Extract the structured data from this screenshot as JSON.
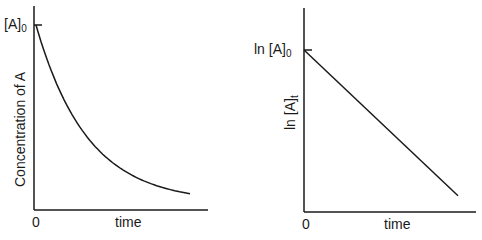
{
  "chart_data": [
    {
      "type": "line",
      "title": "",
      "xlabel": "time",
      "ylabel": "Concentration of A",
      "x_tick_labels": [
        "0"
      ],
      "y_tick_labels": [
        "[A]0"
      ],
      "y_tick_main": "[A]",
      "y_tick_sub": "0",
      "curve": "exponential decay",
      "x": [
        0,
        0.1,
        0.2,
        0.3,
        0.4,
        0.5,
        0.6,
        0.7,
        0.8,
        0.9,
        1.0
      ],
      "values": [
        1.0,
        0.74,
        0.55,
        0.41,
        0.3,
        0.22,
        0.16,
        0.12,
        0.09,
        0.07,
        0.05
      ],
      "grid": false,
      "legend": "none"
    },
    {
      "type": "line",
      "title": "",
      "xlabel": "time",
      "ylabel": "ln [A]t",
      "ylabel_main": "ln [A]",
      "ylabel_sub": "t",
      "x_tick_labels": [
        "0"
      ],
      "y_tick_labels": [
        "ln [A]0"
      ],
      "y_tick_main": "ln [A]",
      "y_tick_sub": "0",
      "curve": "linear decrease",
      "x": [
        0,
        1.0
      ],
      "values": [
        1.0,
        0.1
      ],
      "grid": false,
      "legend": "none"
    }
  ]
}
